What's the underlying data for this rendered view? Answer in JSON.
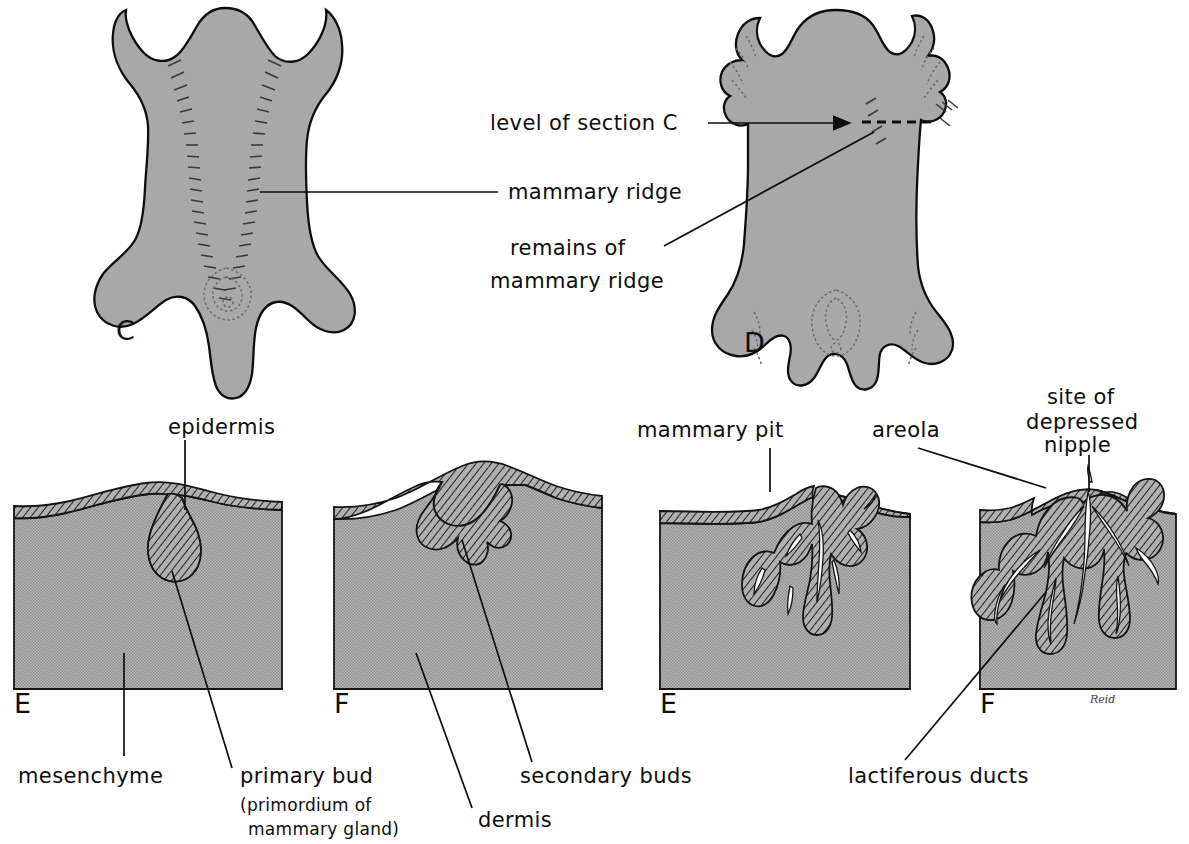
{
  "figure": {
    "signature": "Reid",
    "colors": {
      "body_fill": "#a8a8a8",
      "mesenchyme_fill": "#ababab",
      "epidermis_hatch": "#9a9a9a",
      "outline": "#0d0d0d",
      "background": "#ffffff",
      "duct_lumen": "#ffffff"
    }
  },
  "panels": [
    {
      "id": "A",
      "letter": "A",
      "x": 116,
      "y": 340,
      "type": "embryo-ventral-view"
    },
    {
      "id": "B",
      "letter": "B",
      "x": 744,
      "y": 352,
      "type": "fetus-ventral-view"
    },
    {
      "id": "C",
      "letter": "C",
      "x": 14,
      "y": 713,
      "type": "skin-section"
    },
    {
      "id": "D",
      "letter": "D",
      "x": 334,
      "y": 713,
      "type": "skin-section"
    },
    {
      "id": "E",
      "letter": "E",
      "x": 660,
      "y": 713,
      "type": "skin-section"
    },
    {
      "id": "F",
      "letter": "F",
      "x": 980,
      "y": 713,
      "type": "skin-section"
    }
  ],
  "labels": {
    "level_of_section_c": "level of section C",
    "mammary_ridge": "mammary ridge",
    "remains_of_line1": "remains of",
    "remains_of_line2": "mammary ridge",
    "epidermis": "epidermis",
    "mesenchyme": "mesenchyme",
    "primary_bud": "primary bud",
    "primary_bud_sub1": "(primordium of",
    "primary_bud_sub2": "mammary gland)",
    "dermis": "dermis",
    "secondary_buds": "secondary buds",
    "mammary_pit": "mammary pit",
    "areola": "areola",
    "site_of_line1": "site of",
    "site_of_line2": "depressed",
    "site_of_line3": "nipple",
    "lactiferous_ducts": "lactiferous  ducts"
  }
}
